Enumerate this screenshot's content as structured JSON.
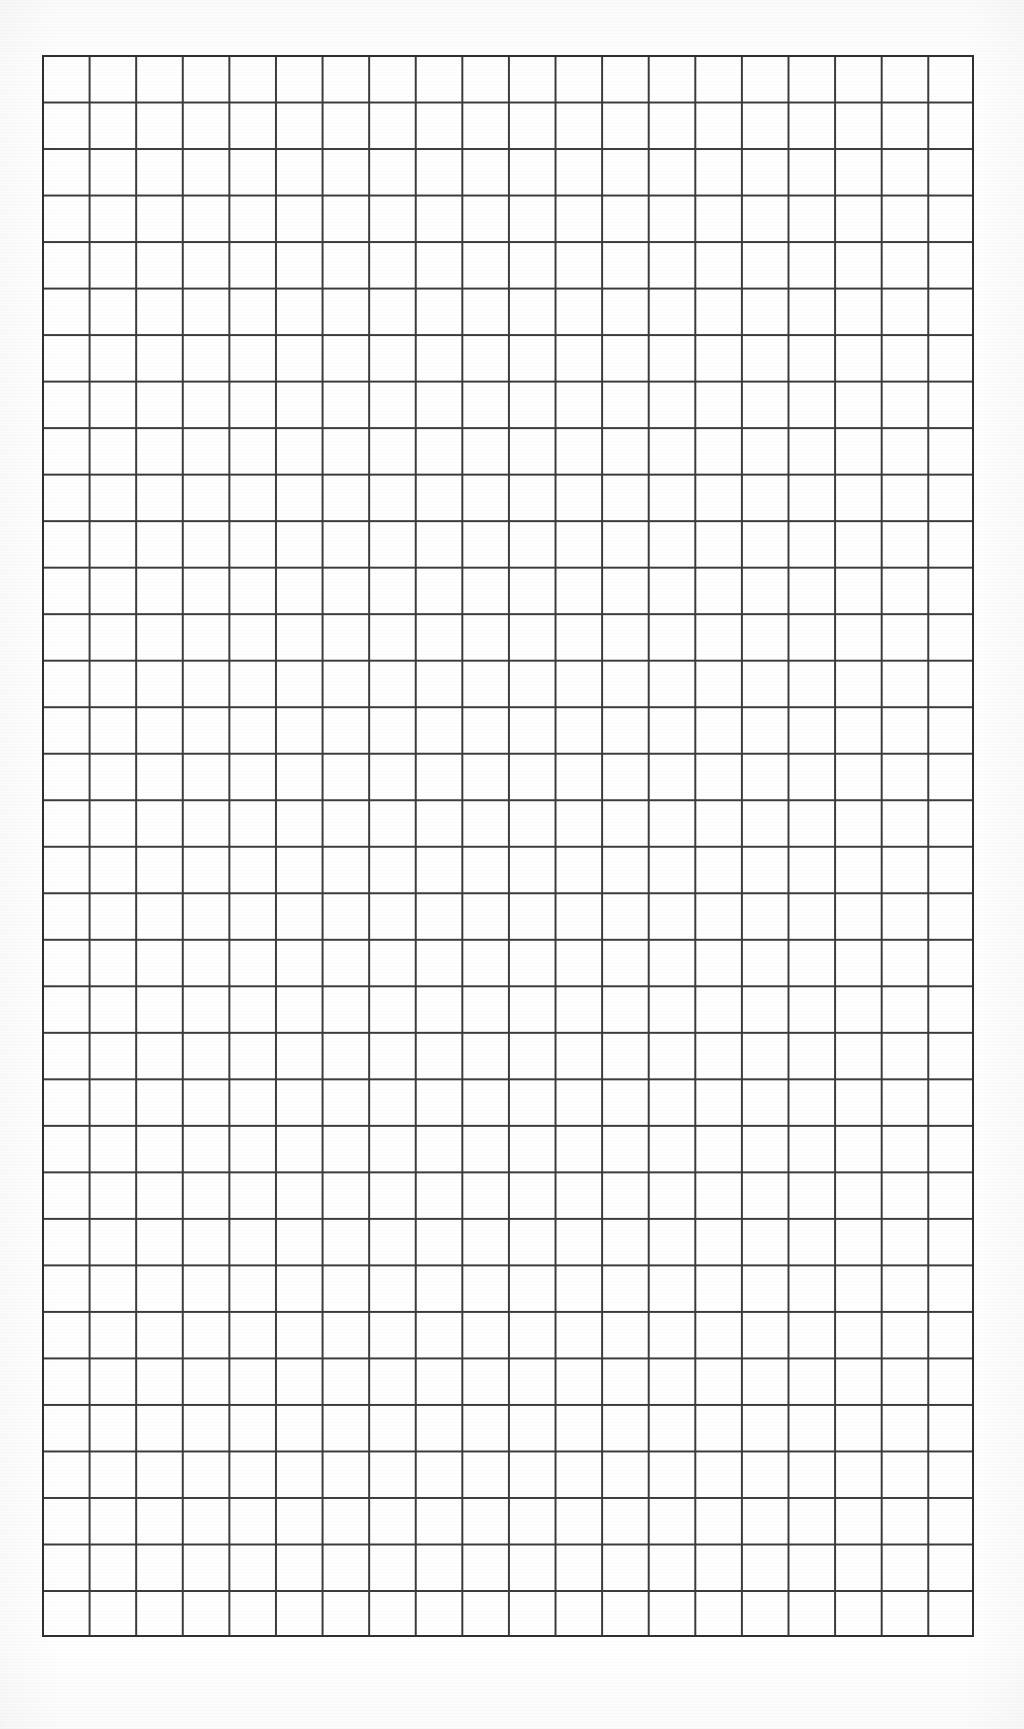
{
  "document": {
    "kind": "grid-paper-scan",
    "title": "Blank grid paper sheet",
    "description": "Scanned blank sheet of squared / graph paper with a single ruled rectangular grid block and no text, numbers, or markings.",
    "page": {
      "width": 1024,
      "height": 1729,
      "background_color": "#ffffff"
    }
  },
  "grid": {
    "name": "square-grid-block",
    "columns": 20,
    "rows": 34,
    "origin_x": 42,
    "origin_y": 55,
    "width": 932,
    "height": 1582,
    "cell_width": 46.6,
    "cell_height": 46.53,
    "line_color": "#3b3b3b",
    "line_width": 2,
    "border_color": "#2f2f2f",
    "border_width": 2,
    "cell_fill_color": "#ffffff",
    "total_cells": 680
  },
  "content": {
    "text_items": [],
    "annotations": [],
    "labels": []
  },
  "chart_data": {
    "type": "table",
    "title": "",
    "xlabel": "",
    "ylabel": "",
    "columns": 20,
    "rows": 34,
    "values": [],
    "grid": true,
    "legend": "none"
  }
}
